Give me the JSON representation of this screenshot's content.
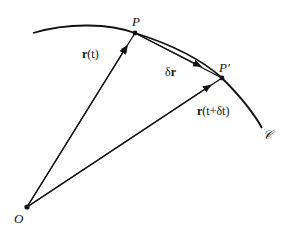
{
  "diagram": {
    "colors": {
      "stroke": "#111111",
      "background": "#ffffff"
    },
    "points": {
      "origin": {
        "label": "O",
        "x": 27,
        "y": 207
      },
      "P": {
        "label": "P",
        "x": 135,
        "y": 33
      },
      "P_prime": {
        "label": "P′",
        "x": 222,
        "y": 78
      }
    },
    "curve": {
      "label": "𝒞",
      "start": {
        "x": 33,
        "y": 33
      },
      "end": {
        "x": 262,
        "y": 128
      }
    },
    "vectors": [
      {
        "id": "r_t",
        "from": "O",
        "to": "P",
        "label_bold": "r",
        "label_rest": "(t)"
      },
      {
        "id": "r_t_dt",
        "from": "O",
        "to": "P′",
        "label_bold": "r",
        "label_rest": "(t+δt)"
      },
      {
        "id": "delta_r",
        "from": "P",
        "to": "P′",
        "label_prefix": "δ",
        "label_bold": "r"
      }
    ]
  }
}
